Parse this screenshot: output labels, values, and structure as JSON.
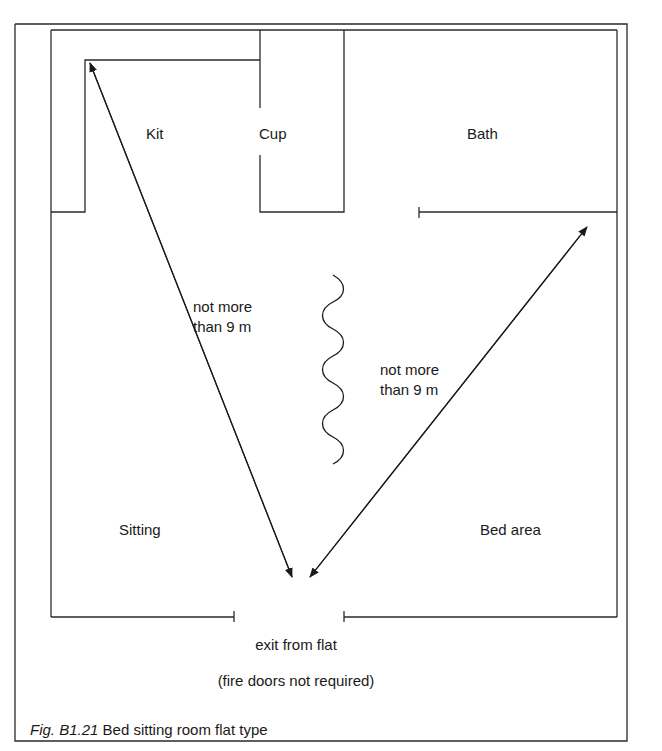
{
  "rooms": {
    "kit": "Kit",
    "cup": "Cup",
    "bath": "Bath",
    "sitting": "Sitting",
    "bed": "Bed area"
  },
  "distances": {
    "left_line1": "not more",
    "left_line2": "than 9 m",
    "right_line1": "not more",
    "right_line2": "than 9 m"
  },
  "exit": {
    "label": "exit from flat",
    "note": "(fire doors not required)"
  },
  "caption": {
    "fig_number": "Fig. B1.21",
    "title": "Bed sitting room flat type"
  },
  "colors": {
    "line": "#2a2a2a",
    "background": "#ffffff"
  }
}
